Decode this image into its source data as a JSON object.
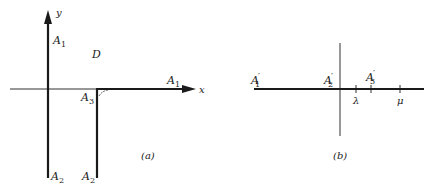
{
  "panel_a": {
    "caption": "(a)",
    "labels": {
      "y_axis": "y",
      "x_axis": "x",
      "a1_top": "A",
      "a1_top_sub": "1",
      "a1_right": "A",
      "a1_right_sub": "1",
      "region": "D",
      "a3": "A",
      "a3_sub": "3",
      "a2_left": "A",
      "a2_left_sub": "2",
      "a2_right": "A",
      "a2_right_sub": "2"
    }
  },
  "panel_b": {
    "caption": "(b)",
    "labels": {
      "a1p": "A",
      "a1p_sub": "1",
      "a2p": "A",
      "a2p_sub": "2",
      "a3p": "A",
      "a3p_sub": "3",
      "prime": "′",
      "lambda": "λ",
      "mu": "μ"
    }
  },
  "colors": {
    "ink": "#1a1a1a",
    "background": "#ffffff"
  }
}
